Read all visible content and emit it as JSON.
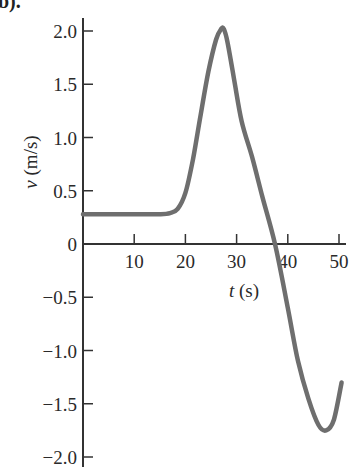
{
  "corner_fragment": "b).",
  "chart_data": {
    "type": "line",
    "title": "",
    "xlabel": "t (s)",
    "ylabel": "v (m/s)",
    "xlabel_var": "t",
    "xlabel_unit": "(s)",
    "ylabel_var": "v",
    "ylabel_unit": "(m/s)",
    "xlim": [
      0,
      51
    ],
    "ylim": [
      -2.0,
      2.0
    ],
    "x_ticks": [
      10,
      20,
      30,
      40,
      50
    ],
    "x_tick_labels": [
      "10",
      "20",
      "30",
      "40",
      "50"
    ],
    "y_ticks": [
      2.0,
      1.5,
      1.0,
      0.5,
      0,
      -0.5,
      -1.0,
      -1.5,
      -2.0
    ],
    "y_tick_labels": [
      "2.0",
      "1.5",
      "1.0",
      "0.5",
      "0",
      "−0.5",
      "−1.0",
      "−1.5",
      "−2.0"
    ],
    "grid": false,
    "legend": null,
    "series": [
      {
        "name": "v(t)",
        "color": "#6e6e6e",
        "x": [
          0,
          5,
          10,
          15,
          17,
          18.5,
          20,
          21.5,
          23,
          24.5,
          26,
          27,
          27.5,
          28.2,
          29.5,
          31,
          33,
          35,
          37.5,
          40,
          42,
          44,
          46,
          47.5,
          49,
          50.5
        ],
        "y": [
          0.28,
          0.28,
          0.28,
          0.28,
          0.29,
          0.33,
          0.48,
          0.8,
          1.22,
          1.62,
          1.92,
          2.02,
          2.02,
          1.9,
          1.55,
          1.15,
          0.82,
          0.45,
          0.0,
          -0.6,
          -1.1,
          -1.45,
          -1.7,
          -1.75,
          -1.65,
          -1.3
        ]
      }
    ],
    "annotations": []
  },
  "colors": {
    "axis": "#333333",
    "curve": "#6e6e6e",
    "text": "#2a2a2a",
    "background": "#ffffff"
  }
}
